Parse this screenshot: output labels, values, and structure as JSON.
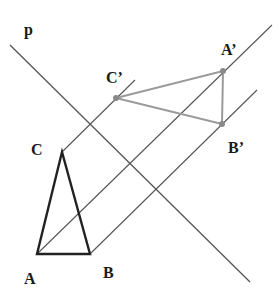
{
  "diagram": {
    "colors": {
      "line": "#555555",
      "original_triangle": "#222222",
      "image_triangle": "#9a9a9a",
      "point": "#8a8a8a",
      "label": "#1a1a1a"
    },
    "labels": {
      "p": "p",
      "A": "A",
      "B": "B",
      "C": "C",
      "A_prime": "A’",
      "B_prime": "B’",
      "C_prime": "C’"
    },
    "points": {
      "A": [
        37,
        254
      ],
      "B": [
        90,
        254
      ],
      "C": [
        62,
        152
      ],
      "A_prime": [
        223,
        71
      ],
      "B_prime": [
        222,
        124
      ],
      "C_prime": [
        116,
        98
      ]
    },
    "lines": {
      "p": [
        [
          10,
          45
        ],
        [
          250,
          282
        ]
      ],
      "through_A": [
        [
          37,
          254
        ],
        [
          272,
          25
        ]
      ],
      "through_B": [
        [
          90,
          254
        ],
        [
          257,
          90
        ]
      ],
      "through_C": [
        [
          62,
          152
        ],
        [
          135,
          80
        ]
      ]
    }
  }
}
